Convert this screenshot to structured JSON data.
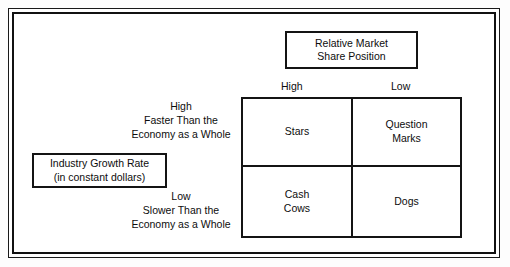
{
  "diagram": {
    "type": "bcg-growth-share-matrix",
    "column_axis": {
      "title_lines": [
        "Relative Market",
        "Share Position"
      ],
      "headers": {
        "left": "High",
        "right": "Low"
      }
    },
    "row_axis": {
      "title_lines": [
        "Industry Growth Rate",
        "(in constant dollars)"
      ],
      "high": {
        "level": "High",
        "description_lines": [
          "Faster Than the",
          "Economy as a Whole"
        ]
      },
      "low": {
        "level": "Low",
        "description_lines": [
          "Slower Than the",
          "Economy as a Whole"
        ]
      }
    },
    "quadrants": {
      "top_left": {
        "lines": [
          "Stars"
        ]
      },
      "top_right": {
        "lines": [
          "Question",
          "Marks"
        ]
      },
      "bottom_left": {
        "lines": [
          "Cash",
          "Cows"
        ]
      },
      "bottom_right": {
        "lines": [
          "Dogs"
        ]
      }
    },
    "colors": {
      "line": "#141414",
      "text": "#0d0d0d",
      "background": "#ffffff"
    }
  }
}
